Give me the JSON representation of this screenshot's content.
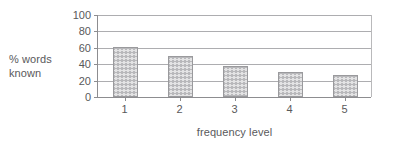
{
  "chart_data": {
    "type": "bar",
    "title": "",
    "categories": [
      "1",
      "2",
      "3",
      "4",
      "5"
    ],
    "values": [
      61,
      50,
      38,
      30,
      27
    ],
    "series": [
      {
        "name": "% words known",
        "values": [
          61,
          50,
          38,
          30,
          27
        ]
      }
    ],
    "xlabel": "frequency level",
    "ylabel": "% words known",
    "ylabel_lines": [
      "% words",
      "known"
    ],
    "ylim": [
      0,
      100
    ],
    "ytick_labels": [
      "0",
      "20",
      "40",
      "60",
      "80",
      "100"
    ],
    "ytick_values": [
      0,
      20,
      40,
      60,
      80,
      100
    ],
    "xtick_labels": [
      "1",
      "2",
      "3",
      "4",
      "5"
    ],
    "grid": "horizontal",
    "legend": "none",
    "colors": {
      "bar_fill": "#e3e3e4",
      "bar_pattern": "#969699",
      "bar_border": "#9a9a9d",
      "gridline": "#adadb0",
      "axis": "#8d8d90",
      "text": "#59595b",
      "background": "#ffffff"
    }
  }
}
